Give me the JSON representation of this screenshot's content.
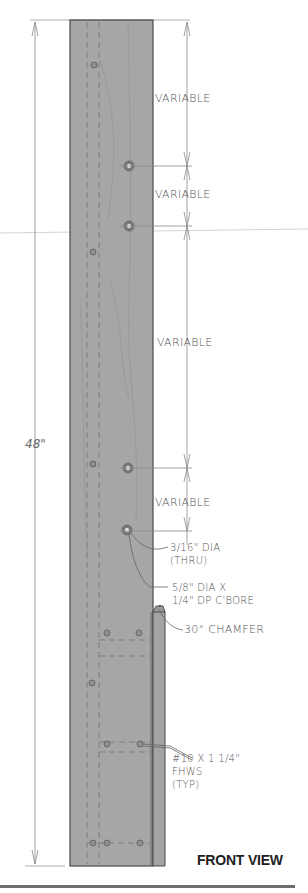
{
  "drawing": {
    "title": "FRONT VIEW",
    "overall_dimension": "48\"",
    "dimensions": [
      {
        "label": "VARIABLE",
        "y": 98
      },
      {
        "label": "VARIABLE",
        "y": 194
      },
      {
        "label": "VARIABLE",
        "y": 342
      },
      {
        "label": "VARIABLE",
        "y": 502
      }
    ],
    "callouts": {
      "thru_hole": "3/16\" DIA\n(THRU)",
      "counterbore": "5/8\" DIA X\n1/4\" DP C'BORE",
      "chamfer": "30° CHAMFER",
      "screws": "#10 X 1 1/4\"\nFHWS\n(TYP)"
    },
    "colors": {
      "board_fill": "#a6a6a6",
      "board_edge": "#4a4a4a",
      "line": "#8a8a8a",
      "text": "#555555",
      "title": "#1e1e1e",
      "rule": "#6e6e6e"
    }
  }
}
